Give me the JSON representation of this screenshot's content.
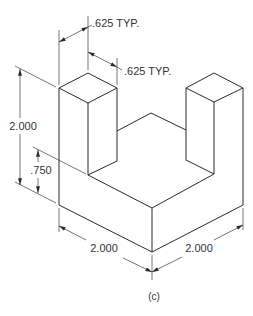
{
  "figure": {
    "caption": "(c)",
    "type": "isometric-drawing",
    "object": "U-shaped block with two square pillars"
  },
  "dimensions": {
    "pillar_width_top": ".625 TYP.",
    "pillar_depth_top": ".625 TYP.",
    "overall_height": "2.000",
    "base_height": ".750",
    "base_width_left": "2.000",
    "base_width_right": "2.000"
  },
  "colors": {
    "line": "#2a2a2a",
    "text": "#333333",
    "background": "#ffffff"
  }
}
